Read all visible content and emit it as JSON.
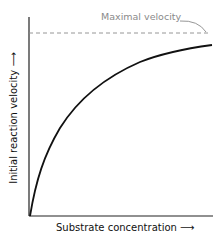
{
  "diagram": {
    "annotation": "Maximal velocity",
    "x_axis_label": "Substrate concentration ⟶",
    "y_axis_label": "Initial reaction velocity ⟶",
    "colors": {
      "curve": "#111111",
      "axes": "#222222",
      "asymptote": "#8a8a8a",
      "annotation": "#8a8a8a"
    }
  }
}
